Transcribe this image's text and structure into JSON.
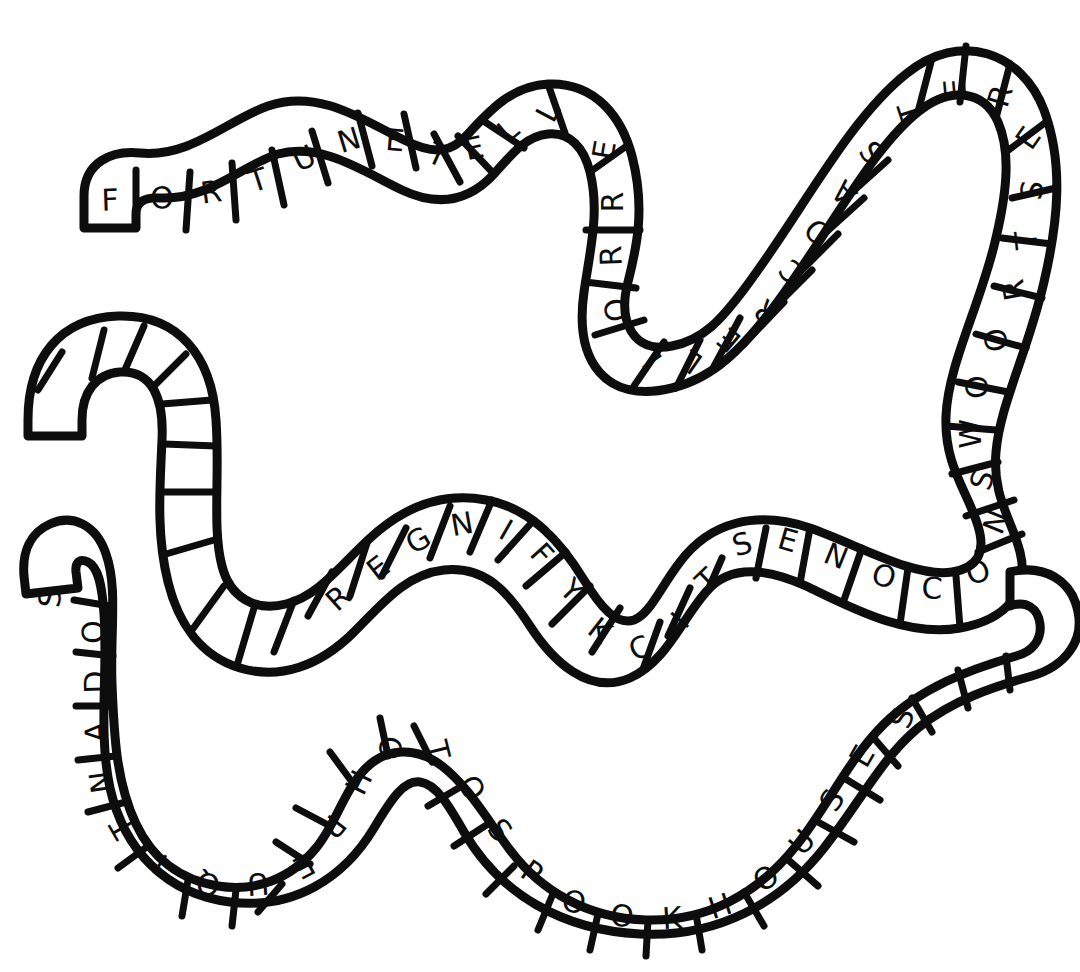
{
  "artwork": {
    "title": "Hand-drawn serpentine letter-band puzzle",
    "background_color": "#ffffff",
    "ink_color": "#0d0d0d",
    "style": "hand-drawn marker outline, white cells, block capitals"
  },
  "bands": [
    {
      "id": "band-top",
      "name": "upper-serpentine-band",
      "phrase": "FORTUNETELLERROLLERCOASTERESTROOWSNOCONESTICKYFINGERS",
      "words": [
        "FORTUNETELLER",
        "ROLLERCOASTER",
        "RESTROOMS",
        "SNOCONES",
        "STICKYFINGERS"
      ],
      "letters": [
        "F",
        "O",
        "R",
        "T",
        "U",
        "N",
        "E",
        "T",
        "E",
        "L",
        "L",
        "E",
        "R",
        "R",
        "O",
        "L",
        "L",
        "E",
        "R",
        "C",
        "O",
        "A",
        "S",
        "T",
        "E",
        "R",
        "E",
        "S",
        "T",
        "R",
        "O",
        "O",
        "W",
        "S",
        "N",
        "O",
        "C",
        "O",
        "N",
        "E",
        "S",
        "T",
        "I",
        "C",
        "K",
        "Y",
        "F",
        "I",
        "N",
        "G",
        "E",
        "R",
        "S"
      ],
      "cell_count": 52
    },
    {
      "id": "band-bottom",
      "name": "lower-serpentine-band",
      "phrase": "SODANTIQUEPHOTOSPOOKHOUSES",
      "words": [
        "SODA",
        "ANTIQUE",
        "PHOTOS",
        "SPOOKHOUSES"
      ],
      "letters": [
        "S",
        "O",
        "D",
        "A",
        "N",
        "T",
        "I",
        "Q",
        "U",
        "E",
        "P",
        "H",
        "O",
        "T",
        "O",
        "S",
        "P",
        "O",
        "O",
        "K",
        "H",
        "O",
        "U",
        "S",
        "E",
        "S"
      ],
      "cell_count": 26
    }
  ],
  "visible_letter_sequence_top": "F O R T U N E T E L L E R O L L E R C O A S T E R E S T R O O W S N O C O N E S T I C K Y F I N G E R S",
  "visible_letter_sequence_bottom": "S O D A N T I Q U E P H O T O S P O O K H O U S E S"
}
